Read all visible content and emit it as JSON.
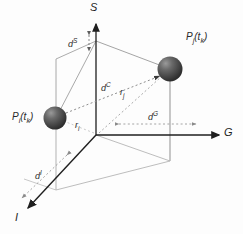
{
  "figure": {
    "background": "#fdfdfd",
    "axes": [
      {
        "name": "S",
        "label": "S",
        "role": "vertical-axis"
      },
      {
        "name": "G",
        "label": "G",
        "role": "horizontal-axis"
      },
      {
        "name": "I",
        "label": "I",
        "role": "depth-axis"
      }
    ],
    "points": [
      {
        "name": "point-i",
        "label_base": "P",
        "label_sub": "i",
        "label_arg": "(t",
        "label_arg_sub": "k",
        "label_arg_end": ")",
        "label_full": "Pi(tk)",
        "color": "#4a4a4a"
      },
      {
        "name": "point-j",
        "label_base": "P",
        "label_sub": "j",
        "label_arg": "(t",
        "label_arg_sub": "k",
        "label_arg_end": ")",
        "label_full": "Pj(tk)",
        "color": "#4a4a4a"
      }
    ],
    "distances": [
      {
        "name": "d-S",
        "base": "d",
        "exp": "S",
        "desc": "vertical S separation"
      },
      {
        "name": "d-C",
        "base": "d",
        "exp": "C",
        "desc": "combined distance between points"
      },
      {
        "name": "d-G",
        "base": "d",
        "exp": "G",
        "desc": "horizontal G separation"
      },
      {
        "name": "d-I",
        "base": "d",
        "exp": "I",
        "desc": "depth I separation"
      }
    ],
    "radii": [
      {
        "name": "r-i",
        "base": "r",
        "sub": "i",
        "desc": "radius vector to point i"
      },
      {
        "name": "r-j",
        "base": "r",
        "sub": "j",
        "desc": "radius vector to point j"
      }
    ],
    "colors": {
      "axis": "#1f1f1f",
      "wire": "#8e8e8e",
      "wire_light": "#b4b4b4",
      "dotted": "#9a9a9a",
      "sphere_dark": "#3c3c3c",
      "sphere_light": "#8a8a8a",
      "text": "#2b2b2b"
    }
  }
}
